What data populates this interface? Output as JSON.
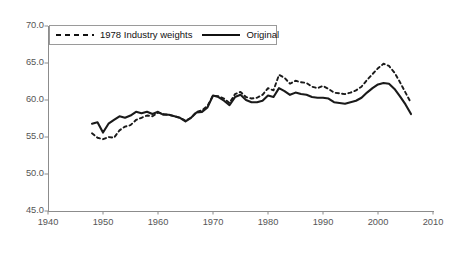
{
  "chart_data": {
    "type": "line",
    "title": "",
    "xlabel": "",
    "ylabel": "",
    "xlim": [
      1940,
      2010
    ],
    "ylim": [
      45.0,
      70.0
    ],
    "grid": false,
    "legend_position": "top-left-inside",
    "x_ticks": [
      "1940",
      "1950",
      "1960",
      "1970",
      "1980",
      "1990",
      "2000",
      "2010"
    ],
    "x_tick_values": [
      1940,
      1950,
      1960,
      1970,
      1980,
      1990,
      2000,
      2010
    ],
    "y_ticks": [
      "45.0",
      "50.0",
      "55.0",
      "60.0",
      "65.0",
      "70.0"
    ],
    "y_tick_values": [
      45.0,
      50.0,
      55.0,
      60.0,
      65.0,
      70.0
    ],
    "series": [
      {
        "name": "1978 Industry weights",
        "style": "dashed",
        "color": "#1a1a1a",
        "x": [
          1948,
          1949,
          1950,
          1951,
          1952,
          1953,
          1954,
          1955,
          1956,
          1957,
          1958,
          1959,
          1960,
          1961,
          1962,
          1963,
          1964,
          1965,
          1966,
          1967,
          1968,
          1969,
          1970,
          1971,
          1972,
          1973,
          1974,
          1975,
          1976,
          1977,
          1978,
          1979,
          1980,
          1981,
          1982,
          1983,
          1984,
          1985,
          1986,
          1987,
          1988,
          1989,
          1990,
          1991,
          1992,
          1993,
          1994,
          1995,
          1996,
          1997,
          1998,
          1999,
          2000,
          2001,
          2002,
          2003,
          2004,
          2005,
          2006
        ],
        "values": [
          55.5,
          54.9,
          54.7,
          55.0,
          54.9,
          55.9,
          56.4,
          56.6,
          57.3,
          57.6,
          57.9,
          57.8,
          58.3,
          58.1,
          58.0,
          57.8,
          57.6,
          57.2,
          57.6,
          58.4,
          58.6,
          59.2,
          60.6,
          60.5,
          60.2,
          59.6,
          60.8,
          61.1,
          60.4,
          60.2,
          60.3,
          60.7,
          61.6,
          61.3,
          63.4,
          63.0,
          62.2,
          62.6,
          62.4,
          62.3,
          61.8,
          61.6,
          61.9,
          61.5,
          61.0,
          60.9,
          60.8,
          61.0,
          61.3,
          61.8,
          62.7,
          63.5,
          64.3,
          64.9,
          64.6,
          63.7,
          62.4,
          61.0,
          59.6
        ]
      },
      {
        "name": "Original",
        "style": "solid",
        "color": "#1a1a1a",
        "x": [
          1948,
          1949,
          1950,
          1951,
          1952,
          1953,
          1954,
          1955,
          1956,
          1957,
          1958,
          1959,
          1960,
          1961,
          1962,
          1963,
          1964,
          1965,
          1966,
          1967,
          1968,
          1969,
          1970,
          1971,
          1972,
          1973,
          1974,
          1975,
          1976,
          1977,
          1978,
          1979,
          1980,
          1981,
          1982,
          1983,
          1984,
          1985,
          1986,
          1987,
          1988,
          1989,
          1990,
          1991,
          1992,
          1993,
          1994,
          1995,
          1996,
          1997,
          1998,
          1999,
          2000,
          2001,
          2002,
          2003,
          2004,
          2005,
          2006
        ],
        "values": [
          56.8,
          57.0,
          55.6,
          56.8,
          57.3,
          57.8,
          57.6,
          57.9,
          58.4,
          58.2,
          58.4,
          58.1,
          58.4,
          58.0,
          58.0,
          57.8,
          57.6,
          57.1,
          57.6,
          58.3,
          58.4,
          59.0,
          60.6,
          60.4,
          59.9,
          59.3,
          60.4,
          60.7,
          60.0,
          59.7,
          59.7,
          59.9,
          60.6,
          60.4,
          61.6,
          61.2,
          60.7,
          61.0,
          60.8,
          60.7,
          60.4,
          60.3,
          60.3,
          60.2,
          59.7,
          59.6,
          59.5,
          59.7,
          59.9,
          60.3,
          61.0,
          61.6,
          62.1,
          62.3,
          62.2,
          61.5,
          60.5,
          59.4,
          58.1
        ]
      }
    ]
  },
  "legend": {
    "entries": [
      {
        "label": "1978 Industry weights",
        "style": "dashed"
      },
      {
        "label": "Original",
        "style": "solid"
      }
    ]
  },
  "axes": {
    "y_labels": [
      "70.0",
      "65.0",
      "60.0",
      "55.0",
      "50.0",
      "45.0"
    ],
    "x_labels": [
      "1940",
      "1950",
      "1960",
      "1970",
      "1980",
      "1990",
      "2000",
      "2010"
    ]
  }
}
